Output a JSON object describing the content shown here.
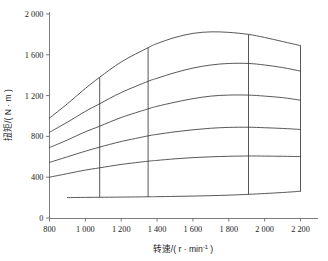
{
  "chart_data": {
    "type": "line",
    "title": "",
    "xlabel": "转速/( r · min-1 )",
    "ylabel": "扭矩/( N · m )",
    "xlim": [
      800,
      2200
    ],
    "ylim": [
      0,
      2000
    ],
    "grid": false,
    "legend": "none",
    "x_ticks": [
      "800",
      "1 000",
      "1 200",
      "1 400",
      "1 600",
      "1 800",
      "2 000",
      "2 200"
    ],
    "x_tick_values": [
      800,
      1000,
      1200,
      1400,
      1600,
      1800,
      2000,
      2200
    ],
    "y_ticks": [
      "0",
      "400",
      "800",
      "1 200",
      "1 600",
      "2 000"
    ],
    "y_tick_values": [
      0,
      400,
      800,
      1200,
      1600,
      2000
    ],
    "x": [
      800,
      900,
      1000,
      1080,
      1200,
      1350,
      1400,
      1500,
      1600,
      1700,
      1800,
      1910,
      2000,
      2100,
      2200
    ],
    "series": [
      {
        "name": "curve-1-full-load",
        "values": [
          980,
          1120,
          1270,
          1380,
          1530,
          1670,
          1710,
          1770,
          1810,
          1825,
          1820,
          1800,
          1770,
          1730,
          1690
        ]
      },
      {
        "name": "curve-2",
        "values": [
          840,
          940,
          1045,
          1120,
          1230,
          1340,
          1370,
          1425,
          1470,
          1500,
          1515,
          1515,
          1500,
          1475,
          1440
        ]
      },
      {
        "name": "curve-3",
        "values": [
          690,
          765,
          845,
          900,
          985,
          1070,
          1095,
          1135,
          1170,
          1195,
          1205,
          1205,
          1195,
          1180,
          1155
        ]
      },
      {
        "name": "curve-4",
        "values": [
          545,
          600,
          655,
          695,
          750,
          805,
          820,
          845,
          865,
          880,
          888,
          890,
          885,
          878,
          868
        ]
      },
      {
        "name": "curve-5",
        "values": [
          400,
          435,
          470,
          492,
          525,
          557,
          565,
          580,
          592,
          600,
          605,
          608,
          607,
          605,
          602
        ]
      },
      {
        "name": "curve-6-idle",
        "values": [
          null,
          200,
          202,
          203,
          205,
          208,
          209,
          212,
          215,
          219,
          224,
          232,
          240,
          250,
          262
        ]
      }
    ],
    "connectors": [
      {
        "name": "connector-1080",
        "x": 1080,
        "y_top": 1380,
        "y_bottom": 203
      },
      {
        "name": "connector-1350",
        "x": 1350,
        "y_top": 1670,
        "y_bottom": 208
      },
      {
        "name": "connector-1910",
        "x": 1910,
        "y_top": 1800,
        "y_bottom": 232
      },
      {
        "name": "connector-2200-right-boundary",
        "x": 2200,
        "y_top": 1690,
        "y_bottom": 262
      }
    ],
    "colors": {
      "curve": "#3a3a3a",
      "axis": "#6d6d6d",
      "background": "#ffffff",
      "text": "#1a1a1a"
    }
  }
}
